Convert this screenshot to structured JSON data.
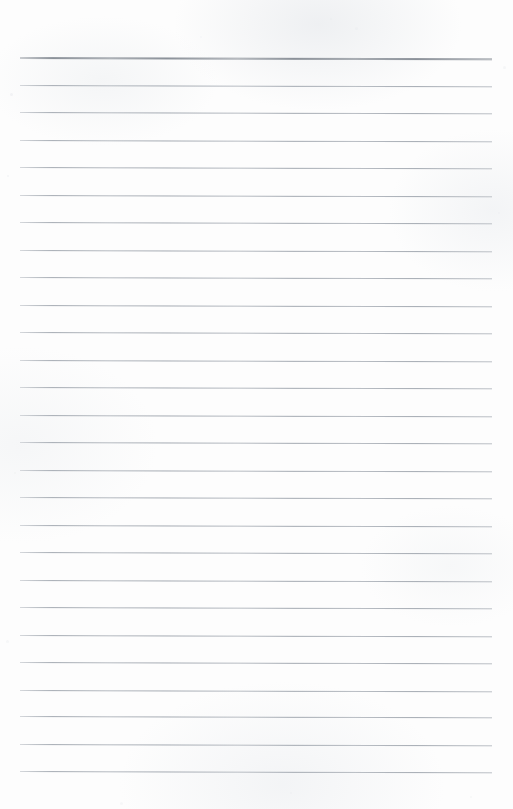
{
  "document": {
    "kind": "scanned-blank-lined-notebook-page",
    "page_width": 513,
    "page_height": 809,
    "background_color": "#fdfdfd",
    "has_text_content": false,
    "written_content": "",
    "notes": "Blank ruled writing sheet; no handwriting, headings, page numbers, margins rules or stamps are present."
  },
  "ruling": {
    "line_count": 27,
    "line_color": "#a4aab2",
    "header_line_color": "#8b9199",
    "line_thickness_px": 1,
    "header_line_thickness_px": 2,
    "left_margin_px": 20,
    "right_edge_px": 492,
    "line_length_px": 472,
    "first_line_y_px": 57,
    "line_spacing_px": 27.5,
    "last_line_y_px": 771,
    "top_blank_margin_px": 57,
    "bottom_blank_margin_px": 38,
    "skew_deg": 0.16,
    "lines": [
      {
        "index": 1,
        "y": 57,
        "emphasis": "header",
        "thickness": 2
      },
      {
        "index": 2,
        "y": 84.5,
        "emphasis": "normal",
        "thickness": 1
      },
      {
        "index": 3,
        "y": 112,
        "emphasis": "normal",
        "thickness": 1
      },
      {
        "index": 4,
        "y": 139.5,
        "emphasis": "normal",
        "thickness": 1
      },
      {
        "index": 5,
        "y": 167,
        "emphasis": "normal",
        "thickness": 1
      },
      {
        "index": 6,
        "y": 194.5,
        "emphasis": "normal",
        "thickness": 1
      },
      {
        "index": 7,
        "y": 222,
        "emphasis": "normal",
        "thickness": 1
      },
      {
        "index": 8,
        "y": 249.5,
        "emphasis": "normal",
        "thickness": 1
      },
      {
        "index": 9,
        "y": 277,
        "emphasis": "normal",
        "thickness": 1
      },
      {
        "index": 10,
        "y": 304.5,
        "emphasis": "normal",
        "thickness": 1
      },
      {
        "index": 11,
        "y": 332,
        "emphasis": "normal",
        "thickness": 1
      },
      {
        "index": 12,
        "y": 359.5,
        "emphasis": "normal",
        "thickness": 1
      },
      {
        "index": 13,
        "y": 387,
        "emphasis": "normal",
        "thickness": 1
      },
      {
        "index": 14,
        "y": 414.5,
        "emphasis": "normal",
        "thickness": 1
      },
      {
        "index": 15,
        "y": 442,
        "emphasis": "normal",
        "thickness": 1
      },
      {
        "index": 16,
        "y": 469.5,
        "emphasis": "normal",
        "thickness": 1
      },
      {
        "index": 17,
        "y": 497,
        "emphasis": "normal",
        "thickness": 1
      },
      {
        "index": 18,
        "y": 524.5,
        "emphasis": "normal",
        "thickness": 1
      },
      {
        "index": 19,
        "y": 552,
        "emphasis": "normal",
        "thickness": 1
      },
      {
        "index": 20,
        "y": 579.5,
        "emphasis": "normal",
        "thickness": 1
      },
      {
        "index": 21,
        "y": 607,
        "emphasis": "normal",
        "thickness": 1
      },
      {
        "index": 22,
        "y": 634.5,
        "emphasis": "normal",
        "thickness": 1
      },
      {
        "index": 23,
        "y": 662,
        "emphasis": "normal",
        "thickness": 1
      },
      {
        "index": 24,
        "y": 689.5,
        "emphasis": "normal",
        "thickness": 1
      },
      {
        "index": 25,
        "y": 716,
        "emphasis": "normal",
        "thickness": 1
      },
      {
        "index": 26,
        "y": 743.5,
        "emphasis": "normal",
        "thickness": 1
      },
      {
        "index": 27,
        "y": 771,
        "emphasis": "normal",
        "thickness": 1
      }
    ]
  },
  "scan_artifacts": {
    "flecks": [
      {
        "x": 10,
        "y": 93,
        "size": 3,
        "opacity": 0.55
      },
      {
        "x": 7,
        "y": 175,
        "size": 2,
        "opacity": 0.45
      },
      {
        "x": 330,
        "y": 18,
        "size": 2,
        "opacity": 0.4
      },
      {
        "x": 355,
        "y": 27,
        "size": 3,
        "opacity": 0.35
      },
      {
        "x": 200,
        "y": 36,
        "size": 2,
        "opacity": 0.3
      },
      {
        "x": 503,
        "y": 66,
        "size": 3,
        "opacity": 0.42
      },
      {
        "x": 498,
        "y": 212,
        "size": 2,
        "opacity": 0.38
      },
      {
        "x": 14,
        "y": 472,
        "size": 2,
        "opacity": 0.34
      },
      {
        "x": 6,
        "y": 640,
        "size": 3,
        "opacity": 0.36
      },
      {
        "x": 470,
        "y": 796,
        "size": 2,
        "opacity": 0.32
      },
      {
        "x": 120,
        "y": 802,
        "size": 3,
        "opacity": 0.3
      },
      {
        "x": 290,
        "y": 792,
        "size": 2,
        "opacity": 0.28
      }
    ]
  }
}
